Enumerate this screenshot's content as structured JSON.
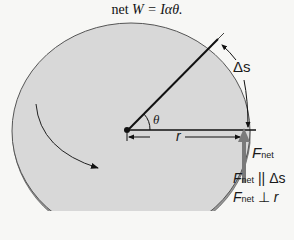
{
  "title": {
    "prefix": "net ",
    "equation": "W = Iαθ."
  },
  "diagram": {
    "theta_label": "θ",
    "r_label": "r",
    "arc_label": "Δs",
    "force_label": "F",
    "force_sub": "net",
    "relation1": {
      "F": "F",
      "sub": "net",
      "op": "||",
      "rhs": "Δs"
    },
    "relation2": {
      "F": "F",
      "sub": "net",
      "op": "⊥",
      "rhs": "r"
    },
    "colors": {
      "disc_top": "#d6d6d6",
      "disc_side": "#9a9a9a",
      "outline": "#555555",
      "force_arrow": "#7a7a7a",
      "background": "#f7f7f5"
    }
  }
}
